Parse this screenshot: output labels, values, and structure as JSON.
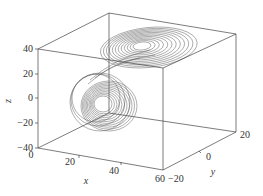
{
  "chart_data": {
    "type": "line3d",
    "title": "",
    "xlabel": "x",
    "ylabel": "y",
    "zlabel": "z",
    "x_ticks": [
      "0",
      "20",
      "40",
      "60"
    ],
    "y_ticks": [
      "-20",
      "0",
      "20"
    ],
    "z_ticks": [
      "40",
      "20",
      "0",
      "-20",
      "-40"
    ],
    "xlim": [
      0,
      60
    ],
    "ylim": [
      -20,
      20
    ],
    "zlim": [
      -40,
      40
    ],
    "series": [
      {
        "name": "trajectory",
        "color": "#555555",
        "lobes": [
          {
            "label": "upper lobe",
            "center_approx": {
              "x": 40,
              "y": 10,
              "z": 15
            }
          },
          {
            "label": "lower lobe",
            "center_approx": {
              "x": 25,
              "y": -5,
              "z": -10
            }
          }
        ]
      }
    ],
    "grid": false,
    "legend": null
  },
  "axes": {
    "x_label": "x",
    "y_label": "y",
    "z_label": "z",
    "x_ticks": [
      {
        "label": "0",
        "px": 31,
        "py": 158
      },
      {
        "label": "20",
        "px": 70,
        "py": 165
      },
      {
        "label": "40",
        "px": 114,
        "py": 174
      },
      {
        "label": "60",
        "px": 160,
        "py": 182
      }
    ],
    "y_ticks": [
      {
        "label": "-20",
        "px": 168,
        "py": 182
      },
      {
        "label": "0",
        "px": 206,
        "py": 160
      },
      {
        "label": "20",
        "px": 240,
        "py": 138
      }
    ],
    "z_ticks": [
      {
        "label": "40",
        "px": 33,
        "py": 52
      },
      {
        "label": "20",
        "px": 33,
        "py": 77
      },
      {
        "label": "0",
        "px": 33,
        "py": 101
      },
      {
        "label": "-20",
        "px": 33,
        "py": 126
      },
      {
        "label": "-40",
        "px": 33,
        "py": 151
      }
    ]
  }
}
